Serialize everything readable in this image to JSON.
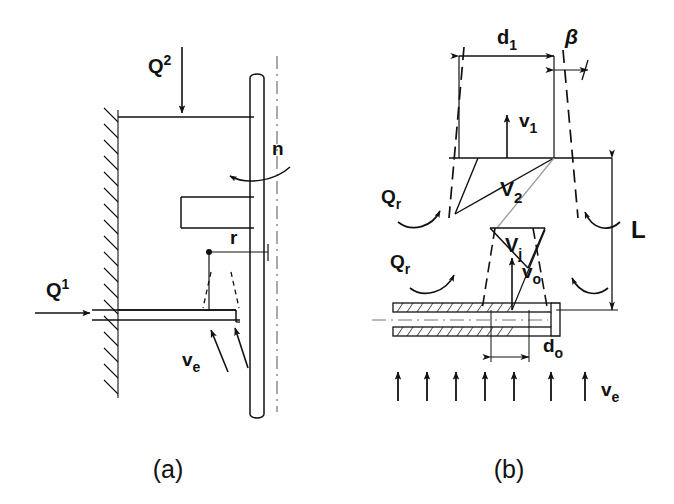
{
  "figure": {
    "panels": [
      {
        "id": "a",
        "caption": "(a)",
        "labels": {
          "q_top": "Q",
          "q_top_sup": "2",
          "q_side": "Q",
          "q_side_sup": "1",
          "rotation": "n",
          "radius": "r",
          "entrainment_velocity": "v",
          "entrainment_velocity_sub": "e"
        }
      },
      {
        "id": "b",
        "caption": "(b)",
        "labels": {
          "spray_diameter": "d",
          "spray_diameter_sub": "1",
          "spray_angle": "β",
          "velocity_1": "v",
          "velocity_1_sub": "1",
          "velocity_2": "V",
          "velocity_2_sub": "2",
          "recirculation_upper": "Q",
          "recirculation_upper_sub": "r",
          "recirculation_lower": "Q",
          "recirculation_lower_sub": "r",
          "jet_velocity": "V",
          "jet_velocity_sub": "j",
          "orifice_velocity": "v",
          "orifice_velocity_sub": "o",
          "breakup_length": "L",
          "orifice_diameter": "d",
          "orifice_diameter_sub": "o",
          "entrainment_velocity": "v",
          "entrainment_velocity_sub": "e"
        }
      }
    ],
    "colors": {
      "ink": "#111111",
      "background": "#ffffff",
      "light_ink": "#555555"
    },
    "entrainment_arrow_count": 7
  }
}
